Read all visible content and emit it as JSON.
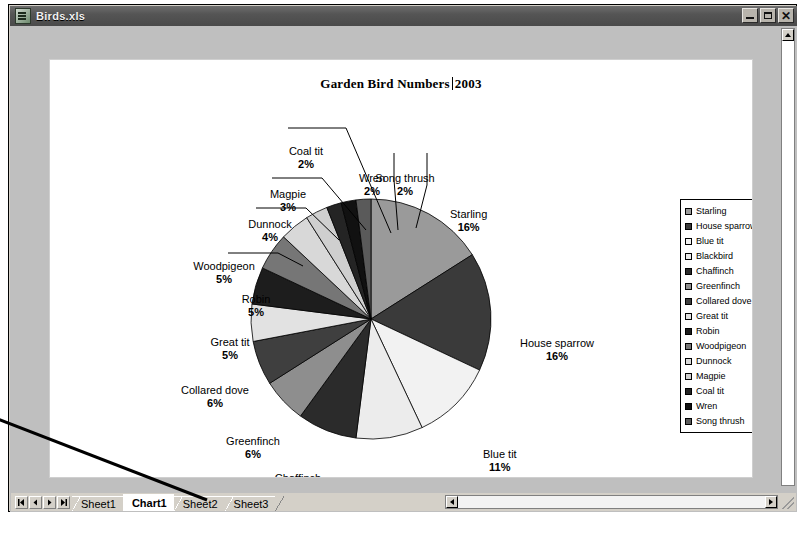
{
  "window": {
    "title": "Birds.xls",
    "icon": "excel-document-icon",
    "buttons": {
      "minimize": "–",
      "maximize": "□",
      "close": "✕"
    }
  },
  "chart_data": {
    "type": "pie",
    "title_parts": {
      "before_caret": "Garden Bird Numbers",
      "after_caret": "2003"
    },
    "legend_position": "right",
    "categories": [
      "Starling",
      "House sparrow",
      "Blue tit",
      "Blackbird",
      "Chaffinch",
      "Greenfinch",
      "Collared dove",
      "Great tit",
      "Robin",
      "Woodpigeon",
      "Dunnock",
      "Magpie",
      "Coal tit",
      "Wren",
      "Song thrush"
    ],
    "values": [
      16,
      16,
      11,
      9,
      8,
      6,
      6,
      5,
      5,
      5,
      4,
      3,
      2,
      2,
      2
    ],
    "value_labels": [
      "16%",
      "16%",
      "11%",
      "9%",
      "8%",
      "6%",
      "6%",
      "5%",
      "5%",
      "5%",
      "4%",
      "3%",
      "2%",
      "2%",
      "2%"
    ],
    "unit": "%",
    "colors": [
      "#9a9a9a",
      "#3a3a3a",
      "#f2f2f2",
      "#ececec",
      "#2b2b2b",
      "#8e8e8e",
      "#3f3f3f",
      "#e2e2e2",
      "#1d1d1d",
      "#767676",
      "#d8d8d8",
      "#cfcfcf",
      "#242424",
      "#111111",
      "#5a5a5a"
    ],
    "slice_labels": [
      {
        "name": "Starling",
        "pct": "16%",
        "left": 400,
        "top": 148,
        "anchor": "left"
      },
      {
        "name": "House sparrow",
        "pct": "16%",
        "left": 470,
        "top": 277,
        "anchor": "left"
      },
      {
        "name": "Blue tit",
        "pct": "11%",
        "left": 433,
        "top": 388,
        "anchor": "left"
      },
      {
        "name": "Blackbird",
        "pct": "9%",
        "left": 340,
        "top": 422,
        "anchor": "center"
      },
      {
        "name": "Chaffinch",
        "pct": "8%",
        "left": 248,
        "top": 412,
        "anchor": "center"
      },
      {
        "name": "Greenfinch",
        "pct": "6%",
        "left": 203,
        "top": 375,
        "anchor": "center"
      },
      {
        "name": "Collared dove",
        "pct": "6%",
        "left": 165,
        "top": 324,
        "anchor": "center"
      },
      {
        "name": "Great tit",
        "pct": "5%",
        "left": 180,
        "top": 276,
        "anchor": "center"
      },
      {
        "name": "Robin",
        "pct": "5%",
        "left": 206,
        "top": 233,
        "anchor": "center"
      },
      {
        "name": "Woodpigeon",
        "pct": "5%",
        "left": 174,
        "top": 200,
        "anchor": "center"
      },
      {
        "name": "Dunnock",
        "pct": "4%",
        "left": 220,
        "top": 158,
        "anchor": "center"
      },
      {
        "name": "Magpie",
        "pct": "3%",
        "left": 238,
        "top": 128,
        "anchor": "center"
      },
      {
        "name": "Coal tit",
        "pct": "2%",
        "left": 256,
        "top": 85,
        "anchor": "center"
      },
      {
        "name": "Wren",
        "pct": "2%",
        "left": 322,
        "top": 112,
        "anchor": "center"
      },
      {
        "name": "Song thrush",
        "pct": "2%",
        "left": 355,
        "top": 112,
        "anchor": "center"
      }
    ]
  },
  "sheet_tabs": {
    "nav_buttons": [
      "first-sheet",
      "previous-sheet",
      "next-sheet",
      "last-sheet"
    ],
    "tabs": [
      {
        "label": "Sheet1",
        "active": false
      },
      {
        "label": "Chart1",
        "active": true
      },
      {
        "label": "Sheet2",
        "active": false
      },
      {
        "label": "Sheet3",
        "active": false
      }
    ]
  },
  "scrollbars": {
    "vertical_up": "▲",
    "horizontal_left": "◄",
    "horizontal_right": "►"
  }
}
